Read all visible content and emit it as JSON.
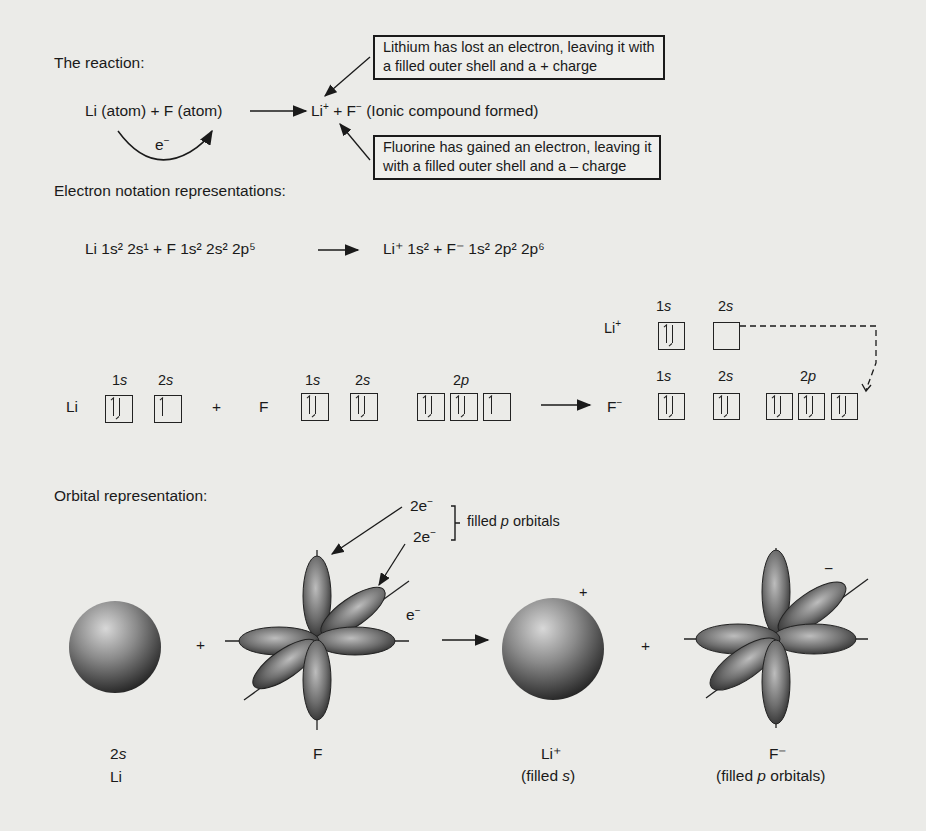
{
  "reaction": {
    "heading": "The reaction:",
    "reactants": "Li (atom) + F (atom)",
    "electron_label": "e",
    "electron_sup": "−",
    "product_li": "Li",
    "product_li_sup": "+",
    "product_plus": " + F",
    "product_f_sup": "−",
    "product_note": " (Ionic compound formed)",
    "callout_li": {
      "line1": "Lithium has lost an electron, leaving it with",
      "line2": "a filled outer shell and a + charge"
    },
    "callout_f": {
      "line1": "Fluorine has gained an electron, leaving it",
      "line2": "with a filled outer shell and a – charge"
    }
  },
  "electron_notation": {
    "heading": "Electron notation representations:",
    "li": "Li 1s² 2s¹",
    "plus": "+",
    "f": "F 1s² 2s² 2p⁵",
    "li_ion": "Li⁺ 1s²",
    "f_ion": "F⁻ 1s² 2p² 2p⁶"
  },
  "box_diagram": {
    "li_label": "Li",
    "f_label": "F",
    "plus": "+",
    "li_ion_label": "Li",
    "li_ion_sup": "+",
    "f_ion_label": "F",
    "f_ion_sup": "−",
    "sub_1s": "1",
    "sub_2s": "2",
    "sub_2p": "2",
    "s": "s",
    "p": "p"
  },
  "orbital": {
    "heading": "Orbital representation:",
    "pair1": "2e",
    "pair2": "2e",
    "minus": "−",
    "brace_label_pre": "filled ",
    "brace_label_p": "p",
    "brace_label_post": " orbitals",
    "e_label": "e",
    "li_sub": "2",
    "li_sub_s": "s",
    "li_name": "Li",
    "f_name": "F",
    "plus": "+",
    "li_ion_name": "Li⁺",
    "li_ion_desc_pre": "(filled ",
    "li_ion_desc_s": "s",
    "li_ion_desc_post": ")",
    "f_ion_name": "F⁻",
    "f_ion_desc_pre": "(filled ",
    "f_ion_desc_p": "p",
    "f_ion_desc_post": " orbitals)",
    "ion_plus": "+",
    "ion_minus": "−"
  }
}
